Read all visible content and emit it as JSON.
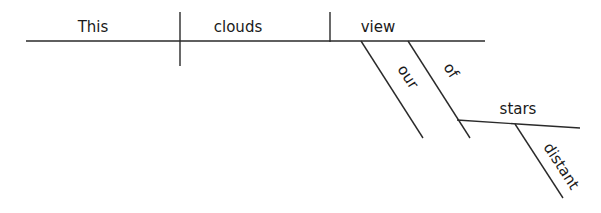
{
  "diagram": {
    "type": "sentence-diagram",
    "sentence": "This clouds our view of distant stars",
    "words": {
      "subject": "This",
      "verb": "clouds",
      "direct_object": "view",
      "modifier_possessive": "our",
      "preposition": "of",
      "prep_object": "stars",
      "adjective": "distant"
    },
    "colors": {
      "line": "#2a2a2a",
      "text": "#1a1a1a",
      "background": "#ffffff"
    }
  }
}
